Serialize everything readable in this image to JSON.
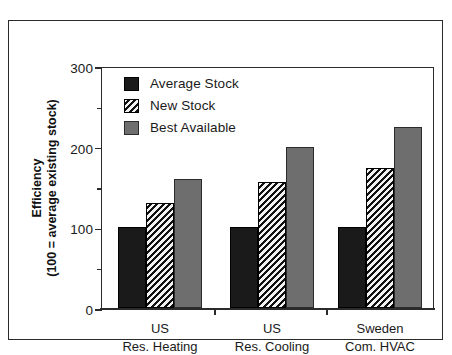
{
  "figure": {
    "frame_color": "#2b2b2b",
    "background": "#ffffff"
  },
  "legend": {
    "position": "top-left-inside",
    "items": [
      {
        "label": "Average Stock",
        "key": "average",
        "color": "#1a1a1a",
        "pattern": "solid-black"
      },
      {
        "label": "New Stock",
        "key": "new",
        "color": "#111111",
        "pattern": "diagonal-hatch"
      },
      {
        "label": "Best Available",
        "key": "best",
        "color": "#6e6e6e",
        "pattern": "solid-gray"
      }
    ]
  },
  "y_axis": {
    "title_line1": "Efficiency",
    "title_line2": "(100 = average existing stock)",
    "major_ticks": [
      0,
      100,
      200,
      300
    ],
    "minor_ticks": [
      50,
      150,
      250
    ],
    "min": 0,
    "max": 300
  },
  "x_axis": {
    "groups": [
      {
        "line1": "US",
        "line2": "Res. Heating"
      },
      {
        "line1": "US",
        "line2": "Res. Cooling"
      },
      {
        "line1": "Sweden",
        "line2": "Com. HVAC"
      }
    ]
  },
  "chart_data": {
    "type": "bar",
    "title": "",
    "subtitle": "",
    "xlabel": "",
    "ylabel": "Efficiency (100 = average existing stock)",
    "ylim": [
      0,
      300
    ],
    "yticks": [
      0,
      100,
      200,
      300
    ],
    "yticks_minor": [
      50,
      150,
      250
    ],
    "grid": false,
    "legend_position": "upper left (inside axes)",
    "categories": [
      "US Res. Heating",
      "US Res. Cooling",
      "Sweden Com. HVAC"
    ],
    "series": [
      {
        "name": "Average Stock",
        "values": [
          100,
          100,
          100
        ],
        "color": "#1a1a1a",
        "pattern": "solid-black"
      },
      {
        "name": "New Stock",
        "values": [
          130,
          156,
          173
        ],
        "color": "#111111",
        "pattern": "diagonal-hatch"
      },
      {
        "name": "Best Available",
        "values": [
          160,
          199,
          225
        ],
        "color": "#6e6e6e",
        "pattern": "solid-gray"
      }
    ],
    "annotations": []
  }
}
